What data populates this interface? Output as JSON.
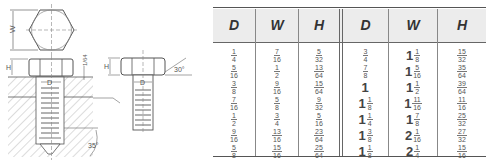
{
  "drawing": {
    "labels": {
      "width": "W",
      "height": "H",
      "diameter": "D",
      "chamfer_height": "1/64",
      "head_angle": "30°",
      "point_angle": "35°"
    }
  },
  "table": {
    "headers": [
      "D",
      "W",
      "H",
      "D",
      "W",
      "H"
    ],
    "rows": [
      [
        {
          "n": "1",
          "d": "4"
        },
        {
          "n": "7",
          "d": "16"
        },
        {
          "n": "5",
          "d": "32"
        },
        {
          "n": "3",
          "d": "4"
        },
        {
          "w": "1",
          "n": "1",
          "d": "8"
        },
        {
          "n": "15",
          "d": "32"
        }
      ],
      [
        {
          "n": "5",
          "d": "16"
        },
        {
          "n": "1",
          "d": "2"
        },
        {
          "n": "13",
          "d": "64"
        },
        {
          "n": "7",
          "d": "8"
        },
        {
          "w": "1",
          "n": "5",
          "d": "16"
        },
        {
          "n": "35",
          "d": "64"
        }
      ],
      [
        {
          "n": "3",
          "d": "8"
        },
        {
          "n": "9",
          "d": "16"
        },
        {
          "n": "15",
          "d": "64"
        },
        {
          "w": "1"
        },
        {
          "w": "1",
          "n": "1",
          "d": "2"
        },
        {
          "n": "39",
          "d": "64"
        }
      ],
      [
        {
          "n": "7",
          "d": "16"
        },
        {
          "n": "5",
          "d": "8"
        },
        {
          "n": "9",
          "d": "32"
        },
        {
          "w": "1",
          "n": "1",
          "d": "8"
        },
        {
          "w": "1",
          "n": "11",
          "d": "16"
        },
        {
          "n": "11",
          "d": "16"
        }
      ],
      [
        {
          "n": "1",
          "d": "2"
        },
        {
          "n": "3",
          "d": "4"
        },
        {
          "n": "5",
          "d": "16"
        },
        {
          "w": "1",
          "n": "1",
          "d": "4"
        },
        {
          "w": "1",
          "n": "7",
          "d": "8"
        },
        {
          "n": "25",
          "d": "32"
        }
      ],
      [
        {
          "n": "9",
          "d": "16"
        },
        {
          "n": "13",
          "d": "16"
        },
        {
          "n": "23",
          "d": "64"
        },
        {
          "w": "1",
          "n": "3",
          "d": "8"
        },
        {
          "w": "2",
          "n": "1",
          "d": "16"
        },
        {
          "n": "27",
          "d": "32"
        }
      ],
      [
        {
          "n": "5",
          "d": "8"
        },
        {
          "n": "15",
          "d": "16"
        },
        {
          "n": "25",
          "d": "64"
        },
        {
          "w": "1",
          "n": "1",
          "d": "8"
        },
        {
          "w": "2",
          "n": "1",
          "d": "4"
        },
        {
          "n": "15",
          "d": "16"
        }
      ]
    ]
  }
}
